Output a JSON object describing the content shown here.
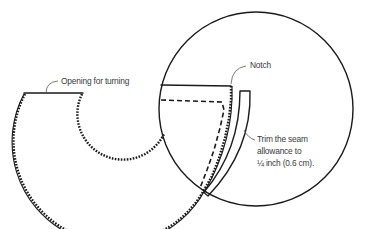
{
  "diagram": {
    "labels": {
      "opening": "Opening for turning",
      "notch": "Notch",
      "trim_line1": "Trim the seam",
      "trim_line2": "allowance to",
      "trim_line3": "¼ inch (0.6 cm)."
    },
    "colors": {
      "line": "#1a1a1a",
      "text": "#3a3a3a",
      "background": "#ffffff"
    },
    "shapes": {
      "circle": {
        "cx": 256,
        "cy": 109,
        "r": 97
      },
      "ring": {
        "cx": 122,
        "cy": 93,
        "outer_r": 98,
        "inner_r": 40
      }
    }
  }
}
